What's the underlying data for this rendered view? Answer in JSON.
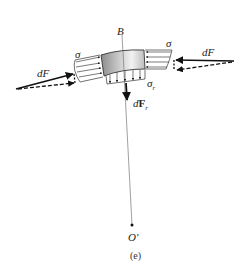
{
  "figure": {
    "caption": "(e)",
    "labels": {
      "B": "B",
      "sigma_left": "σ",
      "sigma_right": "σ",
      "sigma_r": "σ",
      "sigma_r_sub": "r",
      "dF_left": "dF",
      "dF_right": "dF",
      "dFr_d": "d",
      "dFr_F": "F",
      "dFr_sub": "r",
      "center": "O'"
    },
    "colors": {
      "line": "#222222",
      "element_fill_dark": "#9a9a9a",
      "element_fill_light": "#e6e6e6",
      "radial_line": "#777777"
    }
  }
}
